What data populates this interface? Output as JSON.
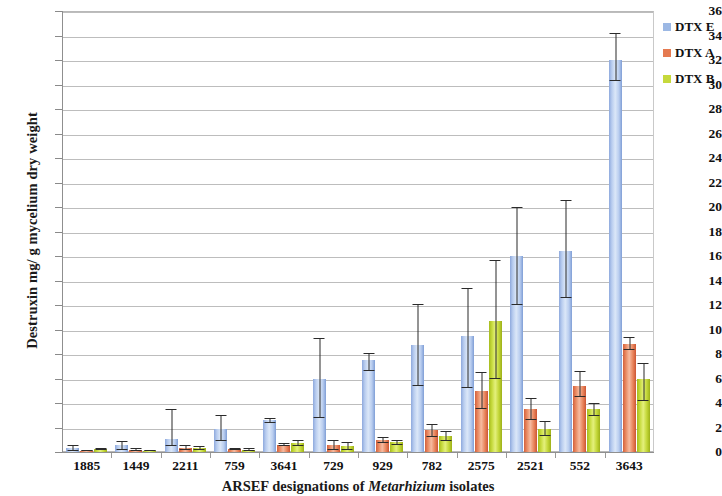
{
  "chart_data": {
    "type": "bar",
    "title": "",
    "xlabel": "ARSEF designations of Metarhizium isolates",
    "ylabel": "Destruxin mg/ g mycelium dry weight",
    "ylim": [
      0,
      36
    ],
    "ytick_step": 2,
    "yticks": [
      0,
      2,
      4,
      6,
      8,
      10,
      12,
      14,
      16,
      18,
      20,
      22,
      24,
      26,
      28,
      30,
      32,
      34,
      36
    ],
    "grid": true,
    "legend_position": "top-right",
    "categories": [
      "1885",
      "1449",
      "2211",
      "759",
      "3641",
      "729",
      "929",
      "782",
      "2575",
      "2521",
      "552",
      "3643"
    ],
    "series": [
      {
        "name": "DTX E",
        "color": "#9cb8e4",
        "values": [
          0.3,
          0.55,
          1.1,
          1.9,
          2.6,
          6.0,
          7.5,
          8.7,
          9.5,
          16.0,
          16.4,
          32.0
        ],
        "err_low": [
          0.05,
          0.2,
          0.5,
          0.9,
          2.35,
          2.8,
          6.6,
          5.4,
          5.2,
          12.0,
          12.6,
          30.3
        ],
        "err_high": [
          0.55,
          0.9,
          3.5,
          3.0,
          2.75,
          9.3,
          8.1,
          12.1,
          13.4,
          20.0,
          20.6,
          34.2
        ]
      },
      {
        "name": "DTX A",
        "color": "#e57a50",
        "values": [
          0.1,
          0.2,
          0.3,
          0.25,
          0.6,
          0.6,
          1.0,
          1.8,
          5.0,
          3.5,
          5.4,
          8.8
        ],
        "err_low": [
          0.05,
          0.1,
          0.15,
          0.15,
          0.5,
          0.2,
          0.75,
          1.2,
          3.5,
          2.6,
          4.5,
          8.3
        ],
        "err_high": [
          0.15,
          0.3,
          0.55,
          0.35,
          0.75,
          1.0,
          1.25,
          2.3,
          6.5,
          4.4,
          6.6,
          9.4
        ]
      },
      {
        "name": "DTX B",
        "color": "#c6d93c",
        "values": [
          0.25,
          0.1,
          0.3,
          0.2,
          0.7,
          0.5,
          0.8,
          1.3,
          10.7,
          1.9,
          3.5,
          6.0
        ],
        "err_low": [
          0.15,
          0.05,
          0.15,
          0.1,
          0.5,
          0.2,
          0.6,
          0.9,
          6.0,
          1.3,
          2.9,
          4.2
        ],
        "err_high": [
          0.35,
          0.2,
          0.5,
          0.3,
          0.95,
          0.85,
          1.0,
          1.7,
          15.7,
          2.5,
          4.0,
          7.3
        ]
      }
    ]
  },
  "legend": {
    "items": [
      {
        "label": "DTX E",
        "color": "#9cb8e4"
      },
      {
        "label": "DTX A",
        "color": "#e57a50"
      },
      {
        "label": "DTX B",
        "color": "#c6d93c"
      }
    ]
  },
  "axes": {
    "y_title": "Destruxin mg/ g mycelium dry weight",
    "x_title_pre": "ARSEF designations of ",
    "x_title_italic": "Metarhizium",
    "x_title_post": " isolates"
  }
}
